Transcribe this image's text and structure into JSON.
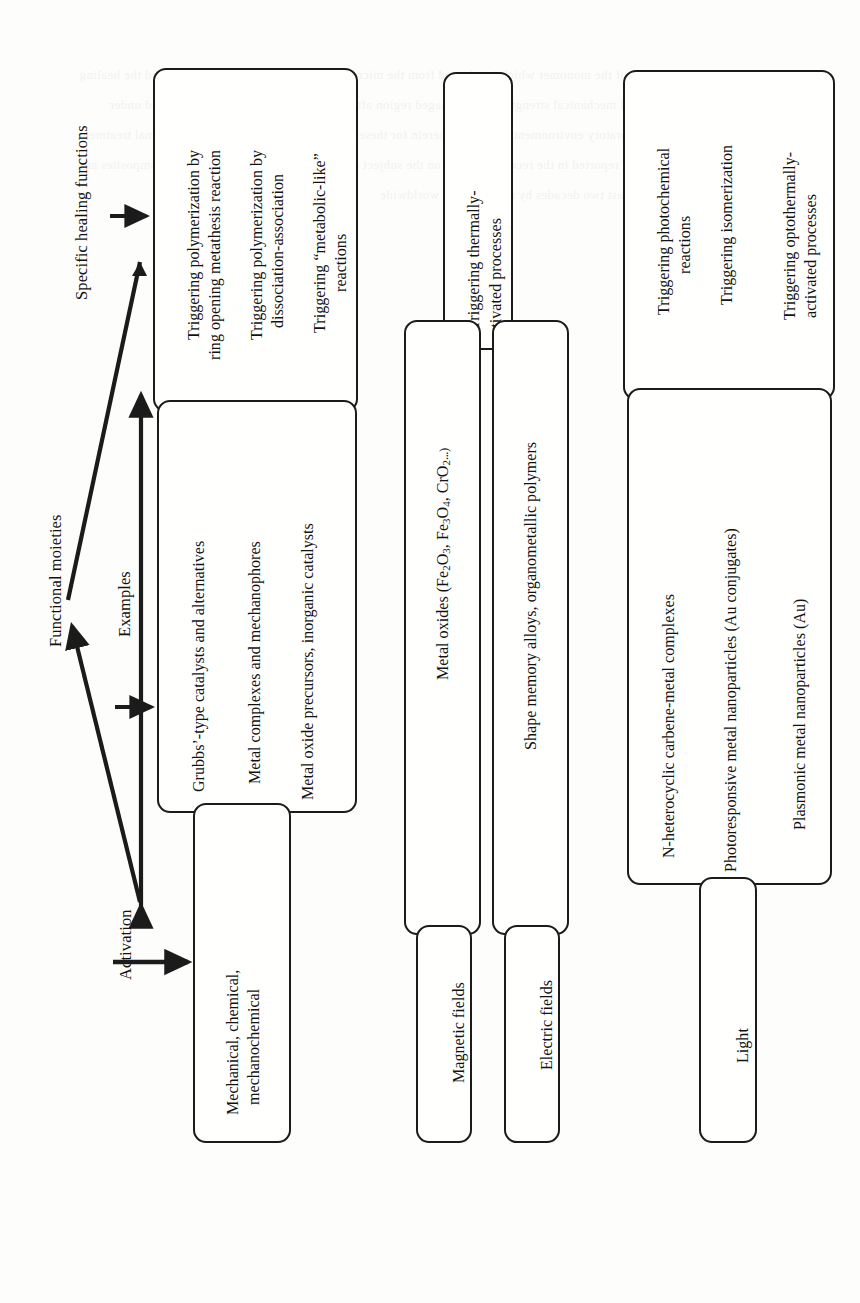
{
  "figure": {
    "orientation": "rotated-90-ccw",
    "stroke_color": "#1b1b1b",
    "background_color": "#fdfdfb",
    "labels": {
      "activation": "Activation",
      "examples": "Examples",
      "functional_moieties": "Functional moieties",
      "specific_healing_functions": "Specific healing functions"
    },
    "groups": [
      {
        "id": "mechanical",
        "stimulus": [
          "Mechanical, chemical,",
          "mechanochemical"
        ],
        "examples": [
          "Grubbs'-type catalysts and alternatives",
          "Metal complexes and mechanophores",
          "Metal oxide precursors, inorganic catalysts"
        ],
        "functions": [
          "Triggering polymerization by ring opening metathesis reaction",
          "Triggering polymerization by dissociation-association",
          "Triggering “metabolic-like” reactions"
        ]
      },
      {
        "id": "magnetic",
        "stimulus": [
          "Magnetic fields"
        ],
        "examples": [
          "Metal oxides (Fe2O3, Fe3O4, CrO2...)"
        ],
        "functions": [
          "Triggering thermally-activated processes"
        ]
      },
      {
        "id": "electric",
        "stimulus": [
          "Electric fields"
        ],
        "examples": [
          "Shape memory alloys, organometallic polymers"
        ],
        "functions": [
          "Triggering thermally-activated processes"
        ]
      },
      {
        "id": "light",
        "stimulus": [
          "Light"
        ],
        "examples": [
          "N-heterocyclic carbene-metal complexes",
          "Photoresponsive metal nanoparticles (Au conjugates)",
          "Plasmonic metal nanoparticles (Au)"
        ],
        "functions": [
          "Triggering photochemical reactions",
          "Triggering isomerization",
          "Triggering optothermally-activated processes"
        ]
      }
    ],
    "text_lines": {
      "trig_rom_1": "Triggering polymerization by",
      "trig_rom_2": "ring opening metathesis reaction",
      "trig_diss_1": "Triggering polymerization by",
      "trig_diss_2": "dissociation-association",
      "trig_meta_1": "Triggering “metabolic-like”",
      "trig_meta_2": "reactions",
      "ex_grubbs": "Grubbs’-type catalysts and alternatives",
      "ex_metalcomplex": "Metal complexes and mechanophores",
      "ex_metaloxide": "Metal oxide precursors, inorganic catalysts",
      "stim_mech_1": "Mechanical, chemical,",
      "stim_mech_2": "mechanochemical",
      "trig_thermal_1": "Triggering thermally-",
      "trig_thermal_2": "activated processes",
      "ex_oxides_pre": "Metal oxides (Fe",
      "ex_oxides_mid1": "O",
      "ex_oxides_mid2": ", Fe",
      "ex_oxides_mid3": "O",
      "ex_oxides_mid4": ", CrO",
      "ex_oxides_end": "...)",
      "ex_sma": "Shape memory alloys, organometallic polymers",
      "stim_magnetic": "Magnetic fields",
      "stim_electric": "Electric fields",
      "trig_photo_1": "Triggering photochemical",
      "trig_photo_2": "reactions",
      "trig_isom": "Triggering isomerization",
      "trig_opto_1": "Triggering optothermally-",
      "trig_opto_2": "activated processes",
      "ex_nhc": "N-heterocyclic carbene-metal complexes",
      "ex_photoresp": "Photoresponsive metal nanoparticles (Au conjugates)",
      "ex_plasmonic": "Plasmonic metal nanoparticles (Au)",
      "stim_light": "Light"
    }
  }
}
